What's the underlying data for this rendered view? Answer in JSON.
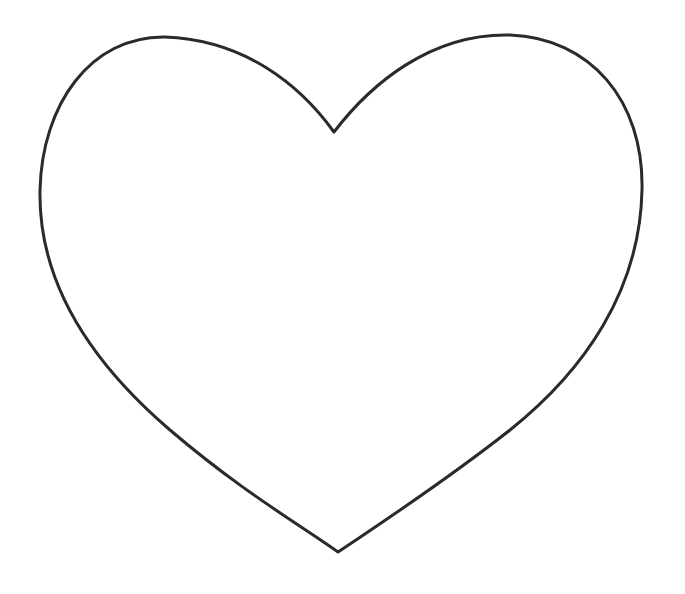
{
  "image": {
    "subject": "heart-outline",
    "background_color": "#ffffff",
    "stroke_color": "#2a2a2a",
    "fill_color": "#ffffff",
    "stroke_width": 3
  },
  "heart": {
    "notch_point": [
      334,
      132
    ],
    "bottom_tip": [
      338,
      552
    ],
    "left_lobe_top": [
      165,
      37
    ],
    "right_lobe_top": [
      510,
      35
    ],
    "leftmost_point": [
      40,
      190
    ],
    "rightmost_point": [
      642,
      190
    ]
  }
}
